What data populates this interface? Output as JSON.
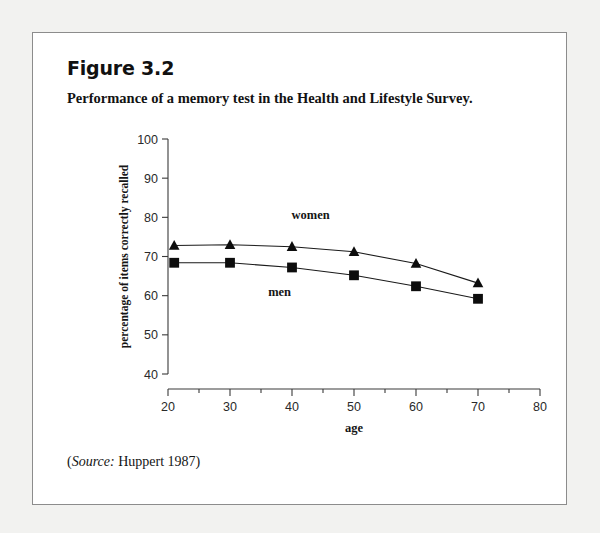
{
  "figure": {
    "number": "Figure 3.2",
    "caption": "Performance of a memory test in the Health and Lifestyle Survey.",
    "source_prefix": "(",
    "source_word": "Source:",
    "source_text": " Huppert 1987)"
  },
  "chart_data": {
    "type": "line",
    "title": "Performance of a memory test in the Health and Lifestyle Survey.",
    "xlabel": "age",
    "ylabel": "percentage of items correctly recalled",
    "x": [
      21,
      30,
      40,
      50,
      60,
      70
    ],
    "xlim": [
      20,
      80
    ],
    "ylim": [
      40,
      100
    ],
    "xticks": [
      20,
      30,
      40,
      50,
      60,
      70,
      80
    ],
    "xtick_labels": [
      "20",
      "30",
      "40",
      "50",
      "60",
      "70",
      "80"
    ],
    "xminor_ticks": [
      25,
      35,
      45,
      55,
      65,
      75
    ],
    "yticks": [
      40,
      50,
      60,
      70,
      80,
      90,
      100
    ],
    "ytick_labels": [
      "40",
      "50",
      "60",
      "70",
      "80",
      "90",
      "100"
    ],
    "grid": false,
    "legend_position": "inline-annotations",
    "series": [
      {
        "name": "women",
        "marker": "triangle",
        "values": [
          72.8,
          73.0,
          72.5,
          71.2,
          68.2,
          63.2
        ]
      },
      {
        "name": "men",
        "marker": "square",
        "values": [
          68.4,
          68.4,
          67.2,
          65.2,
          62.4,
          59.2
        ]
      }
    ],
    "annotations": [
      {
        "text": "women",
        "x": 43,
        "y": 79.5
      },
      {
        "text": "men",
        "x": 38,
        "y": 60.0
      }
    ]
  }
}
